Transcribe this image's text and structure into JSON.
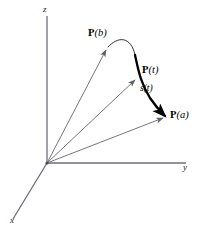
{
  "figure": {
    "background_color": "#ffffff",
    "axis_color": "#6e6e78",
    "vector_color": "#6e6e78",
    "curve_color": "#1a1a1a",
    "bold_curve_color": "#000000",
    "label_color": "#000000"
  },
  "axes": [
    {
      "id": "z",
      "label": "z",
      "direction": "up",
      "origin": [
        47,
        163
      ],
      "tip": [
        47,
        16
      ]
    },
    {
      "id": "y",
      "label": "y",
      "direction": "right",
      "origin": [
        47,
        163
      ],
      "tip": [
        186,
        163
      ]
    },
    {
      "id": "x",
      "label": "x",
      "direction": "down-left",
      "origin": [
        47,
        163
      ],
      "tip": [
        13,
        219
      ]
    }
  ],
  "origin": {
    "label": "O",
    "x": 47,
    "y": 163
  },
  "points": [
    {
      "id": "Pb",
      "vecname": "P",
      "arg": "(b)",
      "x": 108,
      "y": 47,
      "label_x": 88,
      "label_y": 28
    },
    {
      "id": "Pt",
      "vecname": "P",
      "arg": "(t)",
      "x": 137,
      "y": 77,
      "label_x": 142,
      "label_y": 65
    },
    {
      "id": "Pa",
      "vecname": "P",
      "arg": "(a)",
      "x": 166,
      "y": 116,
      "label_x": 170,
      "label_y": 110
    }
  ],
  "vectors": [
    {
      "id": "vec-Pb",
      "from": [
        47,
        163
      ],
      "to": [
        108,
        47
      ],
      "arrowhead": true,
      "weight": "thin"
    },
    {
      "id": "vec-Pt",
      "from": [
        47,
        163
      ],
      "to": [
        137,
        77
      ],
      "arrowhead": true,
      "weight": "thin"
    },
    {
      "id": "vec-Pa",
      "from": [
        47,
        163
      ],
      "to": [
        166,
        116
      ],
      "arrowhead": true,
      "weight": "thin"
    }
  ],
  "curve": {
    "id": "space-curve",
    "description": "curve passing through P(a), P(t) and P(b)",
    "thin_segment_path": "M 108 47 C 118 36, 131 36, 135 55",
    "bold_segment_path": "M 135 55 C 138 68, 140 82, 150 98 C 156 107, 161 112, 166 116",
    "start_point": "Pb",
    "end_point": "Pa"
  },
  "arc_length": {
    "id": "arc-length-label",
    "text": "s(t)",
    "x": 140,
    "y": 84,
    "measures_from": "Pt",
    "measures_to": "Pa"
  },
  "labels": {
    "z_axis": "z",
    "y_axis": "y",
    "x_axis": "x",
    "point_b_name": "P",
    "point_b_arg": "(b)",
    "point_t_name": "P",
    "point_t_arg": "(t)",
    "point_a_name": "P",
    "point_a_arg": "(a)",
    "arc_length": "s(t)"
  }
}
